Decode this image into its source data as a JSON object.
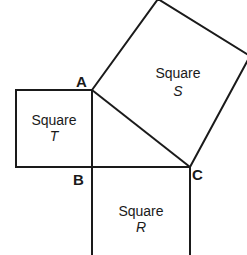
{
  "diagram": {
    "vertices": {
      "A": {
        "label": "A",
        "x": 92,
        "y": 90
      },
      "B": {
        "label": "B",
        "x": 92,
        "y": 167
      },
      "C": {
        "label": "C",
        "x": 190,
        "y": 167
      }
    },
    "squares": [
      {
        "id": "T",
        "word": "Square",
        "name": "T",
        "side": "AB"
      },
      {
        "id": "S",
        "word": "Square",
        "name": "S",
        "side": "AC"
      },
      {
        "id": "R",
        "word": "Square",
        "name": "R",
        "side": "BC"
      }
    ],
    "colors": {
      "stroke": "#1a1a1a",
      "background": "#ffffff"
    }
  }
}
